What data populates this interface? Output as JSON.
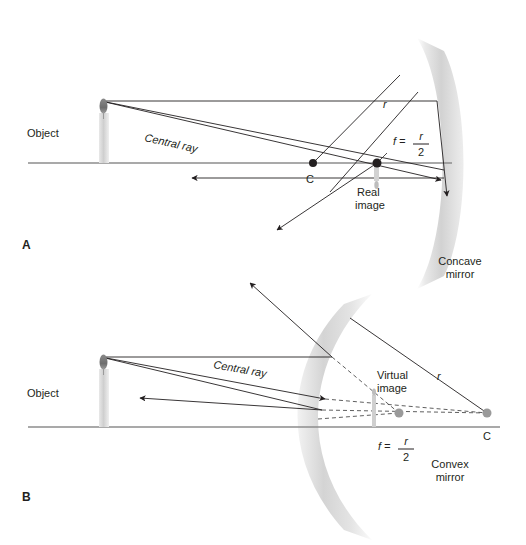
{
  "figure": {
    "background_color": "#ffffff",
    "line_color": "#231f20",
    "axis_color": "#8d8d8d",
    "mirror_fill": "#d9d9d9",
    "dashed_color": "#4d4d4d"
  },
  "panels": [
    {
      "letter": "A",
      "mirror_type_line1": "Concave",
      "mirror_type_line2": "mirror",
      "object_label": "Object",
      "central_ray_label": "Central ray",
      "radius_label": "r",
      "center_label": "C",
      "focal_eq_lhs": "f =",
      "focal_numerator": "r",
      "focal_denominator": "2",
      "image_label_line1": "Real",
      "image_label_line2": "image",
      "geometry": {
        "axis_y": 163,
        "axis_x1": 28,
        "axis_x2": 452,
        "object_base_x": 104,
        "object_top_y": 101,
        "center_point_x": 313,
        "focal_point_x": 377,
        "mirror_vertex_x": 444,
        "image_tip_y": 186
      }
    },
    {
      "letter": "B",
      "mirror_type_line1": "Convex",
      "mirror_type_line2": "mirror",
      "object_label": "Object",
      "central_ray_label": "Central ray",
      "radius_label": "r",
      "center_label": "C",
      "focal_eq_lhs": "f =",
      "focal_numerator": "r",
      "focal_denominator": "2",
      "image_label_line1": "Virtual",
      "image_label_line2": "image",
      "geometry": {
        "axis_y": 427,
        "axis_x1": 28,
        "axis_x2": 500,
        "object_base_x": 104,
        "object_top_y": 357,
        "center_point_x": 487,
        "center_point_y": 413,
        "focal_point_x": 399,
        "focal_point_y": 413,
        "mirror_vertex_x": 318
      }
    }
  ]
}
